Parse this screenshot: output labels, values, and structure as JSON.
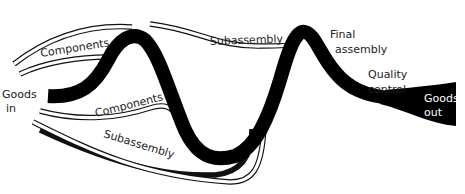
{
  "diagram": {
    "colors": {
      "main_path": "#000000",
      "feed_lines": "#111111",
      "label_text": "#222222",
      "out_text": "#ffffff",
      "background": "#ffffff"
    },
    "labels": {
      "goods_in_line1": "Goods",
      "goods_in_line2": "in",
      "components_top": "Components",
      "components_bottom": "Components",
      "subassembly_top": "Subassembly",
      "subassembly_bottom": "Subassembly",
      "final_assembly_line1": "Final",
      "final_assembly_line2": "assembly",
      "quality_control_line1": "Quality",
      "quality_control_line2": "control",
      "goods_out_line1": "Goods",
      "goods_out_line2": "out"
    }
  }
}
